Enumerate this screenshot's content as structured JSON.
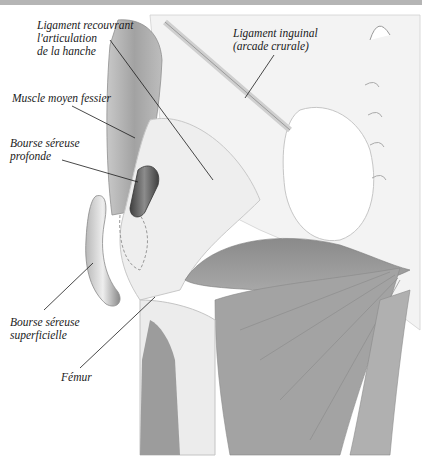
{
  "diagram": {
    "colors": {
      "top_bar": "#b5b5b5",
      "muscle": "#9a9a9a",
      "muscle_dark": "#7e7e7e",
      "ligament": "#ececec",
      "bursa": "#5a5a5a",
      "leader_line": "#1a1a1a"
    },
    "labels": [
      {
        "id": "ligament-hanche",
        "text": "Ligament recouvrant\nl'articulation\nde la hanche"
      },
      {
        "id": "ligament-inguinal",
        "text": "Ligament inguinal\n(arcade crurale)"
      },
      {
        "id": "muscle-moyen-fessier",
        "text": "Muscle moyen fessier"
      },
      {
        "id": "bourse-profonde",
        "text": "Bourse séreuse\nprofonde"
      },
      {
        "id": "bourse-superficielle",
        "text": "Bourse séreuse\nsuperficielle"
      },
      {
        "id": "femur",
        "text": "Fémur"
      }
    ]
  }
}
